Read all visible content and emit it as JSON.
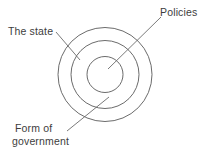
{
  "diagram": {
    "type": "concentric-circles",
    "background_color": "#ffffff",
    "stroke_color": "#5a5a5a",
    "text_color": "#3d3d3d",
    "center": {
      "x": 105,
      "y": 74.5
    },
    "rings": [
      {
        "name": "outer-ring",
        "label_ref": "the_state",
        "radius": 47
      },
      {
        "name": "middle-ring",
        "label_ref": "form_of_government",
        "radius": 34
      },
      {
        "name": "inner-ring",
        "label_ref": "policies",
        "radius": 18
      }
    ],
    "labels": {
      "the_state": "The state",
      "policies": "Policies",
      "form_of_government_line1": "Form of",
      "form_of_government_line2": "government"
    },
    "leader_lines": [
      {
        "name": "leader-the-state",
        "from": {
          "x": 56,
          "y": 32
        },
        "to": {
          "x": 80,
          "y": 60
        }
      },
      {
        "name": "leader-policies",
        "from": {
          "x": 161,
          "y": 17
        },
        "to": {
          "x": 108,
          "y": 69
        }
      },
      {
        "name": "leader-form-of-government",
        "from": {
          "x": 67,
          "y": 131
        },
        "to": {
          "x": 109,
          "y": 97
        }
      }
    ]
  }
}
